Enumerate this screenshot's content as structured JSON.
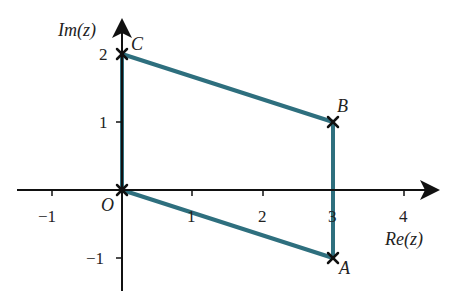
{
  "diagram": {
    "type": "argand-diagram",
    "axes": {
      "x_label": "Re(z)",
      "y_label": "Im(z)",
      "origin_label": "O",
      "x_ticks": [
        {
          "value": -1,
          "label": "−1"
        },
        {
          "value": 1,
          "label": "1"
        },
        {
          "value": 2,
          "label": "2"
        },
        {
          "value": 3,
          "label": "3"
        },
        {
          "value": 4,
          "label": "4"
        }
      ],
      "y_ticks": [
        {
          "value": -1,
          "label": "−1"
        },
        {
          "value": 1,
          "label": "1"
        },
        {
          "value": 2,
          "label": "2"
        }
      ],
      "x_range": [
        -1.5,
        4.5
      ],
      "y_range": [
        -1.5,
        2.5
      ]
    },
    "points": [
      {
        "name": "O",
        "re": 0,
        "im": 0
      },
      {
        "name": "A",
        "re": 3,
        "im": -1
      },
      {
        "name": "B",
        "re": 3,
        "im": 1
      },
      {
        "name": "C",
        "re": 0,
        "im": 2
      }
    ],
    "polygon": [
      "O",
      "A",
      "B",
      "C"
    ],
    "colors": {
      "edge": "#2e6f7e",
      "axis": "#111111",
      "marker": "#111111"
    }
  }
}
